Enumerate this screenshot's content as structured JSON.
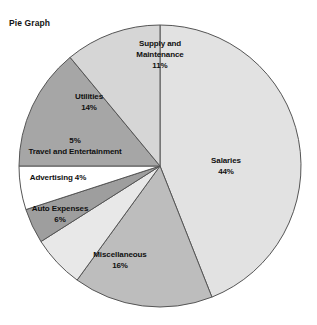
{
  "title": "Pie Graph",
  "chart_data": {
    "type": "pie",
    "title": "Pie Graph",
    "xlabel": "",
    "ylabel": "",
    "legend": "none",
    "grid": false,
    "total_percent": 100,
    "categories": [
      "Salaries",
      "Miscellaneous",
      "Auto Expenses",
      "Advertising",
      "Travel and Entertainment",
      "Utilities",
      "Supply and Maintenance"
    ],
    "values": [
      44,
      16,
      6,
      4,
      5,
      14,
      11
    ],
    "slices": [
      {
        "label": "Salaries",
        "value": 44,
        "percent_text": "44%",
        "color": "#e2e2e2",
        "label_lines": [
          "Salaries",
          "44%"
        ]
      },
      {
        "label": "Miscellaneous",
        "value": 16,
        "percent_text": "16%",
        "color": "#bdbdbd",
        "label_lines": [
          "Miscellaneous",
          "16%"
        ]
      },
      {
        "label": "Auto Expenses",
        "value": 6,
        "percent_text": "6%",
        "color": "#e8e8e8",
        "label_lines": [
          "Auto Expenses",
          "6%"
        ]
      },
      {
        "label": "Advertising",
        "value": 4,
        "percent_text": "4%",
        "color": "#9e9e9e",
        "label_lines": [
          "Advertising 4%"
        ]
      },
      {
        "label": "Travel and Entertainment",
        "value": 5,
        "percent_text": "5%",
        "color": "#ffffff",
        "label_lines": [
          "5%",
          "Travel and Entertainment"
        ]
      },
      {
        "label": "Utilities",
        "value": 14,
        "percent_text": "14%",
        "color": "#a6a6a6",
        "label_lines": [
          "Utilities",
          "14%"
        ]
      },
      {
        "label": "Supply and Maintenance",
        "value": 11,
        "percent_text": "11%",
        "color": "#d6d6d6",
        "label_lines": [
          "Supply and",
          "Maintenance",
          "11%"
        ]
      }
    ],
    "geometry": {
      "center_x": 160,
      "center_y": 166,
      "radius": 141,
      "start_angle_deg": -90,
      "direction": "clockwise",
      "outline_color": "#555555"
    }
  }
}
